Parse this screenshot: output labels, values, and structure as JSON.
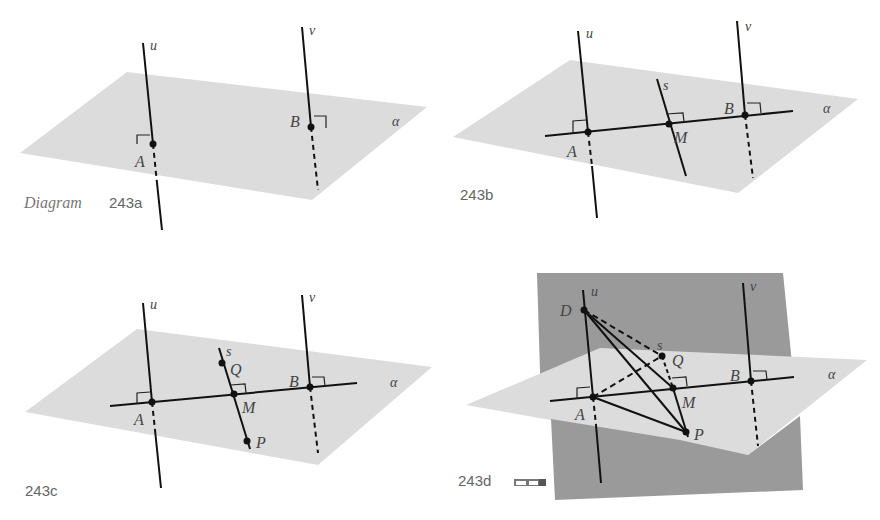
{
  "diagrams": [
    {
      "id": "243a",
      "caption_prefix": "Diagram",
      "caption": "243a",
      "labels": {
        "u": "u",
        "v": "v",
        "A": "A",
        "B": "B",
        "alpha": "α"
      }
    },
    {
      "id": "243b",
      "caption": "243b",
      "labels": {
        "u": "u",
        "v": "v",
        "s": "s",
        "A": "A",
        "B": "B",
        "M": "M",
        "alpha": "α"
      }
    },
    {
      "id": "243c",
      "caption": "243c",
      "labels": {
        "u": "u",
        "v": "v",
        "s": "s",
        "A": "A",
        "B": "B",
        "M": "M",
        "Q": "Q",
        "P": "P",
        "alpha": "α"
      }
    },
    {
      "id": "243d",
      "caption": "243d",
      "icon": "3d-glasses-icon",
      "labels": {
        "u": "u",
        "v": "v",
        "s": "s",
        "A": "A",
        "B": "B",
        "M": "M",
        "Q": "Q",
        "P": "P",
        "D": "D",
        "alpha": "α"
      }
    }
  ],
  "colors": {
    "plane_light": "#dcdcdc",
    "plane_dark": "#9a9a9a",
    "line": "#111111",
    "label": "#444444"
  }
}
